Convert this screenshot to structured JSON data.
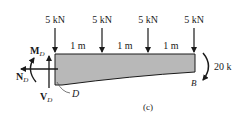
{
  "figure": {
    "caption": "(c)",
    "loads": [
      {
        "label": "5 kN",
        "x": 55
      },
      {
        "label": "5 kN",
        "x": 102
      },
      {
        "label": "5 kN",
        "x": 148
      },
      {
        "label": "5 kN",
        "x": 194
      }
    ],
    "spans": [
      {
        "label": "1 m",
        "x": 78
      },
      {
        "label": "1 m",
        "x": 125
      },
      {
        "label": "1 m",
        "x": 171
      }
    ],
    "moment_at_end": "20 k",
    "point_left": "D",
    "point_right": "B",
    "internal_forces": {
      "moment": "M",
      "moment_sub": "D",
      "normal": "N",
      "normal_sub": "D",
      "shear": "V",
      "shear_sub": "D"
    },
    "colors": {
      "beam_fill": "#b8b8b8",
      "ink": "#1a1a1a"
    }
  }
}
